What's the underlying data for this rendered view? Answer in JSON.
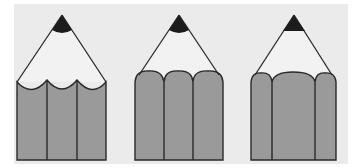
{
  "figure": {
    "colors": {
      "page": "#ffffff",
      "panel": "#ebebeb",
      "wood": "#efefef",
      "body": "#9a9a9a",
      "lead": "#1c1c1c",
      "line": "#2a2a2a"
    },
    "pencils": [
      {
        "id": "pencil-concave",
        "profile": "concave-scalloped"
      },
      {
        "id": "pencil-convex",
        "profile": "convex-rounded"
      },
      {
        "id": "pencil-wide-middle",
        "profile": "convex-wide-middle-facet"
      }
    ]
  }
}
